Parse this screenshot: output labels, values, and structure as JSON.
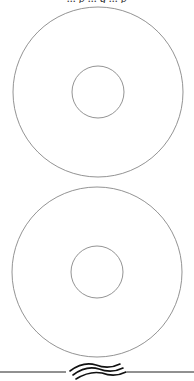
{
  "page": {
    "top_text_clipped": "... p ... g ... p",
    "stroke_color": "#777777",
    "background": "#ffffff"
  },
  "figures": [
    {
      "name": "disc-top",
      "outer": {
        "cx": 98,
        "cy": 92,
        "r": 85
      },
      "inner": {
        "cx": 98,
        "cy": 92,
        "r": 26
      }
    },
    {
      "name": "disc-bottom",
      "outer": {
        "cx": 97,
        "cy": 272,
        "r": 85
      },
      "inner": {
        "cx": 97,
        "cy": 272,
        "r": 26
      }
    }
  ],
  "divider": {
    "y": 372,
    "symbol": "wavy-break"
  }
}
